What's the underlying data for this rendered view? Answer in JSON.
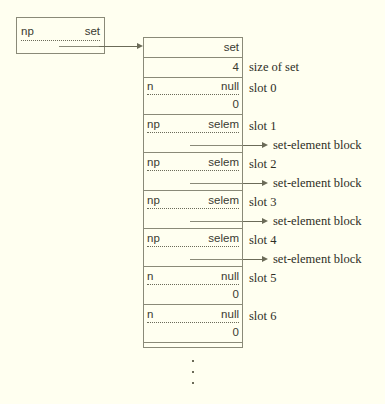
{
  "diagram": {
    "colors": {
      "background": "#fffff0",
      "stroke": "#8a8a78",
      "text": "#3a3a30",
      "label_text": "#2e2e26"
    },
    "pointer_box": {
      "name_label": "np",
      "type_label": "set"
    },
    "header_rows": [
      {
        "id": "set-header",
        "left": "",
        "right": "set",
        "annotation": ""
      },
      {
        "id": "size-row",
        "left": "",
        "right": "4",
        "annotation": "size of set"
      }
    ],
    "slots": [
      {
        "id": "slot-0",
        "annotation": "slot 0",
        "left": "n",
        "right": "null",
        "value": "0",
        "has_pointer": false,
        "pointer_label": ""
      },
      {
        "id": "slot-1",
        "annotation": "slot 1",
        "left": "np",
        "right": "selem",
        "value": "",
        "has_pointer": true,
        "pointer_label": "set-element block"
      },
      {
        "id": "slot-2",
        "annotation": "slot 2",
        "left": "np",
        "right": "selem",
        "value": "",
        "has_pointer": true,
        "pointer_label": "set-element block"
      },
      {
        "id": "slot-3",
        "annotation": "slot 3",
        "left": "np",
        "right": "selem",
        "value": "",
        "has_pointer": true,
        "pointer_label": "set-element block"
      },
      {
        "id": "slot-4",
        "annotation": "slot 4",
        "left": "np",
        "right": "selem",
        "value": "",
        "has_pointer": true,
        "pointer_label": "set-element block"
      },
      {
        "id": "slot-5",
        "annotation": "slot 5",
        "left": "n",
        "right": "null",
        "value": "0",
        "has_pointer": false,
        "pointer_label": ""
      },
      {
        "id": "slot-6",
        "annotation": "slot 6",
        "left": "n",
        "right": "null",
        "value": "0",
        "has_pointer": false,
        "pointer_label": ""
      }
    ],
    "continuation": "⋮"
  }
}
